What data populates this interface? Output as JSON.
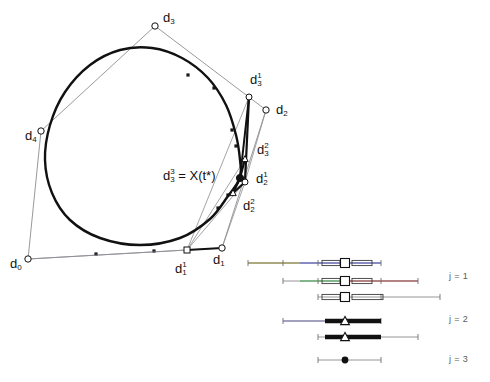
{
  "figure": {
    "title": ""
  },
  "labels": {
    "d0": {
      "base": "d",
      "sub": "0",
      "sup": "",
      "x": 10,
      "y": 257
    },
    "d4": {
      "base": "d",
      "sub": "4",
      "sup": "",
      "x": 25,
      "y": 129
    },
    "d3": {
      "base": "d",
      "sub": "3",
      "sup": "",
      "x": 163,
      "y": 11
    },
    "d3_1": {
      "base": "d",
      "sub": "3",
      "sup": "1",
      "x": 250,
      "y": 72
    },
    "d2": {
      "base": "d",
      "sub": "2",
      "sup": "",
      "x": 276,
      "y": 103
    },
    "d3_2": {
      "base": "d",
      "sub": "3",
      "sup": "2",
      "x": 257,
      "y": 142
    },
    "d2_1": {
      "base": "d",
      "sub": "2",
      "sup": "1",
      "x": 256,
      "y": 171
    },
    "d2_2": {
      "base": "d",
      "sub": "2",
      "sup": "2",
      "x": 243,
      "y": 198
    },
    "d1": {
      "base": "d",
      "sub": "1",
      "sup": "",
      "x": 213,
      "y": 253
    },
    "d1_1": {
      "base": "d",
      "sub": "1",
      "sup": "1",
      "x": 175,
      "y": 261
    },
    "xstar": {
      "text": "d",
      "sub": "3",
      "sup": "3",
      "eq": " = X(t*)",
      "x": 163,
      "y": 168
    }
  },
  "knot_diagram": {
    "rows": [
      {
        "id": "j1-a",
        "y": 263,
        "line": {
          "x1": 248,
          "x2": 381
        },
        "ticks": [
          248,
          283,
          318,
          381
        ],
        "colors": [
          {
            "x1": 248,
            "x2": 300,
            "c": "#8a8a30"
          },
          {
            "x1": 300,
            "x2": 381,
            "c": "#4a4ab8"
          }
        ],
        "marker": {
          "type": "square",
          "x": 345,
          "y": 263
        },
        "bars": [
          {
            "x1": 322,
            "x2": 340,
            "y": 263
          },
          {
            "x1": 352,
            "x2": 372,
            "y": 263
          }
        ]
      },
      {
        "id": "j1-b",
        "y": 281,
        "line": {
          "x1": 283,
          "x2": 418
        },
        "ticks": [
          283,
          318,
          381,
          418
        ],
        "colors": [
          {
            "x1": 300,
            "x2": 345,
            "c": "#3fa14a"
          },
          {
            "x1": 345,
            "x2": 418,
            "c": "#9b3a3a"
          }
        ],
        "marker": {
          "type": "square",
          "x": 345,
          "y": 281
        },
        "bars": [
          {
            "x1": 322,
            "x2": 340,
            "y": 281
          },
          {
            "x1": 352,
            "x2": 372,
            "y": 281
          }
        ]
      },
      {
        "id": "j1-c",
        "y": 297,
        "line": {
          "x1": 318,
          "x2": 440
        },
        "ticks": [
          318,
          381,
          440
        ],
        "colors": [],
        "marker": {
          "type": "square",
          "x": 345,
          "y": 297
        },
        "bars": [
          {
            "x1": 322,
            "x2": 340,
            "y": 297
          },
          {
            "x1": 352,
            "x2": 383,
            "y": 297
          }
        ]
      },
      {
        "id": "j2-a",
        "y": 321,
        "line": {
          "x1": 283,
          "x2": 381
        },
        "ticks": [
          283,
          381
        ],
        "colors": [
          {
            "x1": 283,
            "x2": 330,
            "c": "#7a7ab0"
          }
        ],
        "marker": {
          "type": "triangle",
          "x": 345,
          "y": 321
        },
        "thick": [
          {
            "x1": 325,
            "x2": 381,
            "y": 321
          }
        ]
      },
      {
        "id": "j2-b",
        "y": 337,
        "line": {
          "x1": 318,
          "x2": 418
        },
        "ticks": [
          318,
          418
        ],
        "colors": [
          {
            "x1": 325,
            "x2": 345,
            "c": "#2f8a4a"
          }
        ],
        "marker": {
          "type": "triangle",
          "x": 345,
          "y": 337
        },
        "thick": [
          {
            "x1": 325,
            "x2": 381,
            "y": 337
          }
        ]
      },
      {
        "id": "j3-a",
        "y": 360,
        "line": {
          "x1": 318,
          "x2": 381
        },
        "ticks": [
          318,
          381
        ],
        "colors": [],
        "marker": {
          "type": "dot",
          "x": 345,
          "y": 360
        },
        "thick": []
      }
    ],
    "level_labels": [
      {
        "text": "j = 1",
        "x": 449,
        "y": 271
      },
      {
        "text": "j = 2",
        "x": 449,
        "y": 314
      },
      {
        "text": "j = 3",
        "x": 449,
        "y": 354
      }
    ]
  },
  "chart_data": {
    "type": "scatter",
    "xlabel": "",
    "ylabel": "",
    "control_polygon": {
      "name": "control polygon",
      "points": [
        {
          "label": "d0",
          "x": 28,
          "y": 259
        },
        {
          "label": "d1",
          "x": 222,
          "y": 248
        },
        {
          "label": "d2",
          "x": 266,
          "y": 110
        },
        {
          "label": "d3",
          "x": 155,
          "y": 26
        },
        {
          "label": "d4",
          "x": 41,
          "y": 131
        }
      ],
      "closed": true
    },
    "level1_points": [
      {
        "label": "d1_1",
        "x": 187,
        "y": 250
      },
      {
        "label": "d2_1",
        "x": 245,
        "y": 182
      },
      {
        "label": "d3_1",
        "x": 249,
        "y": 97
      }
    ],
    "level2_points": [
      {
        "label": "d2_2",
        "x": 233,
        "y": 193
      },
      {
        "label": "d3_2",
        "x": 245,
        "y": 159
      }
    ],
    "level3_points": [
      {
        "label": "d3_3",
        "x": 240,
        "y": 178,
        "note": "= X(t*)"
      }
    ],
    "curve": {
      "name": "B-spline curve",
      "closed": true,
      "path_points": [
        {
          "x": 240,
          "y": 178
        },
        {
          "x": 228,
          "y": 196
        },
        {
          "x": 210,
          "y": 219
        },
        {
          "x": 180,
          "y": 238
        },
        {
          "x": 140,
          "y": 245
        },
        {
          "x": 100,
          "y": 238
        },
        {
          "x": 70,
          "y": 220
        },
        {
          "x": 52,
          "y": 193
        },
        {
          "x": 45,
          "y": 160
        },
        {
          "x": 50,
          "y": 125
        },
        {
          "x": 65,
          "y": 92
        },
        {
          "x": 90,
          "y": 65
        },
        {
          "x": 120,
          "y": 50
        },
        {
          "x": 152,
          "y": 48
        },
        {
          "x": 182,
          "y": 58
        },
        {
          "x": 208,
          "y": 78
        },
        {
          "x": 226,
          "y": 105
        },
        {
          "x": 236,
          "y": 135
        },
        {
          "x": 240,
          "y": 160
        }
      ]
    },
    "polygon_midpoint_markers": [
      {
        "x": 96,
        "y": 254
      },
      {
        "x": 154,
        "y": 251
      },
      {
        "x": 188,
        "y": 75
      },
      {
        "x": 214,
        "y": 88
      },
      {
        "x": 232,
        "y": 130
      },
      {
        "x": 236,
        "y": 146
      },
      {
        "x": 218,
        "y": 208
      },
      {
        "x": 228,
        "y": 195
      }
    ]
  }
}
